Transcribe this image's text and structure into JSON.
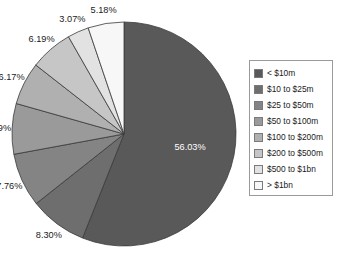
{
  "title_cropped": "",
  "chart_data": {
    "type": "pie",
    "title": "",
    "xlabel": "",
    "ylabel": "",
    "legend_position": "right",
    "grid": false,
    "categories": [
      "< $10m",
      "$10 to $25m",
      "$25 to $50m",
      "$50 to $100m",
      "$100 to $200m",
      "$200 to $500m",
      "$500 to $1bn",
      "> $1bn"
    ],
    "values": [
      56.03,
      8.3,
      7.76,
      7.29,
      6.17,
      6.19,
      3.07,
      5.18
    ],
    "labels": [
      "56.03%",
      "8.30%",
      "7.76%",
      "7.29%",
      "6.17%",
      "6.19%",
      "3.07%",
      "5.18%"
    ],
    "unit": "%",
    "colors": [
      "#595959",
      "#6e6e6e",
      "#848484",
      "#9a9a9a",
      "#b0b0b0",
      "#c6c6c6",
      "#e2e2e2",
      "#f7f7f7"
    ],
    "slice_border_color": "#3a3a3a",
    "start_angle_deg": -90,
    "direction": "clockwise"
  },
  "legend": {
    "items": [
      {
        "label": "< $10m",
        "color": "#595959"
      },
      {
        "label": "$10 to $25m",
        "color": "#6e6e6e"
      },
      {
        "label": "$25 to $50m",
        "color": "#848484"
      },
      {
        "label": "$50 to $100m",
        "color": "#9a9a9a"
      },
      {
        "label": "$100 to $200m",
        "color": "#b0b0b0"
      },
      {
        "label": "$200 to $500m",
        "color": "#c6c6c6"
      },
      {
        "label": "$500 to $1bn",
        "color": "#e2e2e2"
      },
      {
        "label": "> $1bn",
        "color": "#f7f7f7"
      }
    ]
  },
  "geometry": {
    "center_x": 124,
    "center_y": 134,
    "radius": 112
  }
}
